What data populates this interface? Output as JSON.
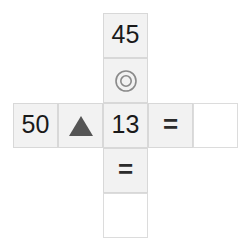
{
  "board": {
    "background_color": "#ffffff",
    "cell_fill_color": "#f2f2f2",
    "cell_empty_color": "#ffffff",
    "cell_border_color": "#d8d8d8",
    "text_color": "#1a1a1a",
    "cell_size": 45,
    "shape": "plus-cross",
    "cells": [
      {
        "id": "top",
        "col": 2,
        "row": 0,
        "kind": "value",
        "text": "45",
        "empty": false
      },
      {
        "id": "upper-operator",
        "col": 2,
        "row": 1,
        "kind": "icon",
        "icon": "concentric-circle-icon",
        "text": "",
        "empty": false
      },
      {
        "id": "left-value",
        "col": 0,
        "row": 2,
        "kind": "value",
        "text": "50",
        "empty": false
      },
      {
        "id": "left-operator",
        "col": 1,
        "row": 2,
        "kind": "icon",
        "icon": "triangle-up-icon",
        "text": "",
        "empty": false
      },
      {
        "id": "center-value",
        "col": 2,
        "row": 2,
        "kind": "value",
        "text": "13",
        "empty": false
      },
      {
        "id": "right-equals",
        "col": 3,
        "row": 2,
        "kind": "operator",
        "text": "=",
        "empty": false
      },
      {
        "id": "right-answer",
        "col": 4,
        "row": 2,
        "kind": "input",
        "text": "",
        "empty": true
      },
      {
        "id": "bottom-equals",
        "col": 2,
        "row": 3,
        "kind": "operator",
        "text": "=",
        "empty": false
      },
      {
        "id": "bottom-answer",
        "col": 2,
        "row": 4,
        "kind": "input",
        "text": "",
        "empty": true
      }
    ]
  }
}
